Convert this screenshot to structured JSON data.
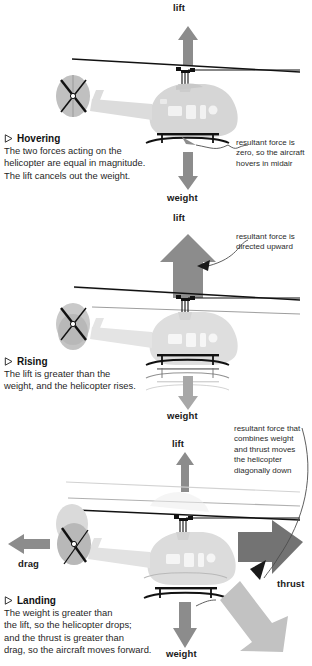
{
  "page": {
    "background": "#ffffff"
  },
  "colors": {
    "arrow_mid_gray": "#8c8c8c",
    "arrow_dark_gray": "#737373",
    "arrow_light_gray": "#c2c2c2",
    "body_gray": "#d6d6d6",
    "ghost_gray": "#e8e8e8",
    "rotor_black": "#111111",
    "text_dark": "#1f1f1f",
    "annotation_gray": "#2b2b2b",
    "leader_line": "#4d4d4d"
  },
  "sections": [
    {
      "id": "hovering",
      "heading": "Hovering",
      "bullet_icon": "triangle-right-outline-icon",
      "body_lines": [
        "The two forces acting on the",
        "helicopter are equal in magnitude.",
        "The lift cancels out the weight."
      ],
      "force_labels": [
        {
          "name": "lift",
          "text": "lift",
          "direction": "up"
        },
        {
          "name": "weight",
          "text": "weight",
          "direction": "down"
        }
      ],
      "annotation": {
        "name": "resultant-force-hovering",
        "lines": [
          "resultant force is",
          "zero, so the aircraft",
          "hovers in midair"
        ]
      }
    },
    {
      "id": "rising",
      "heading": "Rising",
      "bullet_icon": "triangle-right-outline-icon",
      "body_lines": [
        "The lift is greater than the",
        "weight, and the helicopter rises."
      ],
      "force_labels": [
        {
          "name": "lift",
          "text": "lift",
          "direction": "up"
        },
        {
          "name": "weight",
          "text": "weight",
          "direction": "down"
        }
      ],
      "annotation": {
        "name": "resultant-force-rising",
        "lines": [
          "resultant force is",
          "directed upward"
        ]
      }
    },
    {
      "id": "landing",
      "heading": "Landing",
      "bullet_icon": "triangle-right-outline-icon",
      "body_lines": [
        "The weight is greater than",
        "the lift, so the helicopter drops;",
        "and the thrust is greater than",
        "drag, so the aircraft moves forward."
      ],
      "force_labels": [
        {
          "name": "lift",
          "text": "lift",
          "direction": "up"
        },
        {
          "name": "weight",
          "text": "weight",
          "direction": "down"
        },
        {
          "name": "drag",
          "text": "drag",
          "direction": "left"
        },
        {
          "name": "thrust",
          "text": "thrust",
          "direction": "right"
        }
      ],
      "annotation": {
        "name": "resultant-force-landing",
        "lines": [
          "resultant force that",
          "combines weight",
          "and thrust moves",
          "the helicopter",
          "diagonally down"
        ]
      }
    }
  ]
}
